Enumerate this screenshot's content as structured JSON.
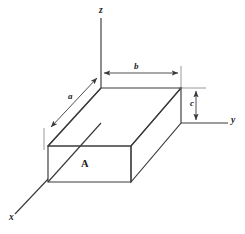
{
  "figure": {
    "type": "3d-rectangular-box-diagram",
    "background_color": "#ffffff",
    "line_color": "#3a3a3a",
    "label_color": "#1a1a1a",
    "axes": [
      {
        "id": "z",
        "label": "z",
        "orientation": "vertical-up"
      },
      {
        "id": "y",
        "label": "y",
        "orientation": "horizontal-right"
      },
      {
        "id": "x",
        "label": "x",
        "orientation": "diagonal-down-left"
      }
    ],
    "dimensions": [
      {
        "id": "b",
        "label": "b",
        "placement": "top",
        "orientation": "horizontal",
        "measures": "width along y"
      },
      {
        "id": "a",
        "label": "a",
        "placement": "upper-left",
        "orientation": "diagonal",
        "measures": "depth along x"
      },
      {
        "id": "c",
        "label": "c",
        "placement": "right",
        "orientation": "vertical",
        "measures": "height along z"
      }
    ],
    "face_labels": [
      {
        "id": "A",
        "label": "A",
        "placement": "front-face",
        "meaning": "area of front face"
      }
    ]
  }
}
